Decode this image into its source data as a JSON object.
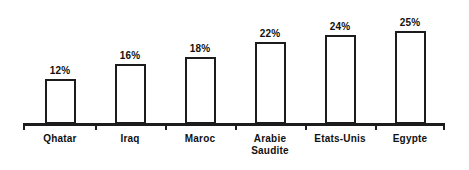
{
  "chart_data": {
    "type": "bar",
    "title": "",
    "subtitle": "",
    "xlabel": "",
    "ylabel": "",
    "ylim": [
      0,
      27
    ],
    "grid": false,
    "legend": false,
    "orientation": "vertical",
    "categories": [
      "Qhatar",
      "Iraq",
      "Maroc",
      "Arabie Saudite",
      "Etats-Unis",
      "Egypte"
    ],
    "values": [
      12,
      16,
      18,
      22,
      24,
      25
    ],
    "value_labels": [
      "12%",
      "16%",
      "18%",
      "22%",
      "24%",
      "25%"
    ],
    "axis_tick_labels": [],
    "bar_fill_color": "#ffffff",
    "bar_border_color": "#1c1c1c",
    "axis_color": "#1c1c1c",
    "background_color": "#ffffff",
    "text_color": "#111111",
    "bars": [
      {
        "category": "Qhatar",
        "label_lines": [
          "Qhatar"
        ],
        "value": 12,
        "value_label": "12%"
      },
      {
        "category": "Iraq",
        "label_lines": [
          "Iraq"
        ],
        "value": 16,
        "value_label": "16%"
      },
      {
        "category": "Maroc",
        "label_lines": [
          "Maroc"
        ],
        "value": 18,
        "value_label": "18%"
      },
      {
        "category": "Arabie Saudite",
        "label_lines": [
          "Arabie",
          "Saudite"
        ],
        "value": 22,
        "value_label": "22%"
      },
      {
        "category": "Etats-Unis",
        "label_lines": [
          "Etats-Unis"
        ],
        "value": 24,
        "value_label": "24%"
      },
      {
        "category": "Egypte",
        "label_lines": [
          "Egypte"
        ],
        "value": 25,
        "value_label": "25%"
      }
    ]
  }
}
